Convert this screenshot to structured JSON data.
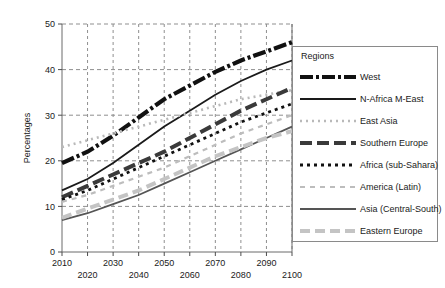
{
  "chart_data": {
    "type": "line",
    "title": "",
    "xlabel": "",
    "ylabel": "Percentages",
    "xlim": [
      2010,
      2100
    ],
    "ylim": [
      0,
      50
    ],
    "grid": true,
    "legend_position": "right",
    "legend_title": "Regions",
    "x_ticks": [
      2010,
      2020,
      2030,
      2040,
      2050,
      2060,
      2070,
      2080,
      2090,
      2100
    ],
    "y_ticks": [
      0,
      10,
      20,
      30,
      40,
      50
    ],
    "x": [
      2010,
      2020,
      2030,
      2040,
      2050,
      2060,
      2070,
      2080,
      2090,
      2100
    ],
    "series": [
      {
        "name": "West",
        "color": "#111111",
        "width": 4.2,
        "dash": "13,3,3,3",
        "values": [
          19.5,
          22.0,
          25.5,
          29.5,
          33.5,
          36.5,
          39.5,
          42.0,
          44.0,
          46.0
        ]
      },
      {
        "name": "N-Africa M-East",
        "color": "#1a1a1a",
        "width": 1.8,
        "dash": "0",
        "values": [
          13.5,
          16.0,
          19.5,
          23.5,
          27.5,
          31.0,
          34.5,
          37.5,
          40.0,
          42.0
        ]
      },
      {
        "name": "East Asia",
        "color": "#b9b9b9",
        "width": 2.6,
        "dash": "2,4",
        "values": [
          23.0,
          24.5,
          26.0,
          27.5,
          29.0,
          30.5,
          32.0,
          33.5,
          34.5,
          35.5
        ]
      },
      {
        "name": "Southern Europe",
        "color": "#3a3a3a",
        "width": 4.0,
        "dash": "12,5",
        "values": [
          12.0,
          14.5,
          17.0,
          19.5,
          22.0,
          25.0,
          28.0,
          31.0,
          33.5,
          36.0
        ]
      },
      {
        "name": "Africa (sub-Sahara)",
        "color": "#111111",
        "width": 2.8,
        "dash": "3,4",
        "values": [
          11.5,
          13.5,
          16.0,
          18.5,
          21.0,
          23.5,
          26.0,
          28.5,
          30.5,
          32.5
        ]
      },
      {
        "name": "America (Latin)",
        "color": "#bdbdbd",
        "width": 2.2,
        "dash": "5,5",
        "values": [
          11.0,
          12.5,
          14.5,
          16.5,
          18.5,
          21.0,
          23.5,
          26.0,
          28.0,
          30.0
        ]
      },
      {
        "name": "Asia (Central-South)",
        "color": "#555555",
        "width": 1.8,
        "dash": "0",
        "values": [
          7.0,
          8.5,
          10.5,
          12.5,
          15.0,
          17.5,
          20.0,
          22.5,
          25.0,
          27.5
        ]
      },
      {
        "name": "Eastern Europe",
        "color": "#c4c4c4",
        "width": 4.0,
        "dash": "10,5",
        "values": [
          7.5,
          9.5,
          11.5,
          13.5,
          16.0,
          18.5,
          21.0,
          23.0,
          25.0,
          26.5
        ]
      }
    ]
  },
  "axes": {
    "y_label": "Percentages",
    "y_tick_labels": [
      "0",
      "10",
      "20",
      "30",
      "40",
      "50"
    ],
    "x_tick_labels_top": [
      "2010",
      "2030",
      "2050",
      "2070",
      "2090"
    ],
    "x_tick_labels_bottom": [
      "2020",
      "2040",
      "2060",
      "2080",
      "2100"
    ]
  },
  "legend": {
    "title": "Regions",
    "items": [
      {
        "label": "West"
      },
      {
        "label": "N-Africa M-East"
      },
      {
        "label": "East Asia"
      },
      {
        "label": "Southern Europe"
      },
      {
        "label": "Africa (sub-Sahara)"
      },
      {
        "label": "America (Latin)"
      },
      {
        "label": "Asia (Central-South)"
      },
      {
        "label": "Eastern Europe"
      }
    ]
  }
}
